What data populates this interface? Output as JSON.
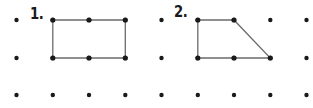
{
  "worksheet": {
    "width": 313,
    "height": 108,
    "background_color": "#ffffff",
    "dot_color": "#1a1a1a",
    "line_color": "#6b6b6b",
    "label_color": "#1a1a1a"
  },
  "grid": {
    "name": "geoboard-dot-grid",
    "columns": 9,
    "rows": 3,
    "x_positions": [
      16.5,
      52.8,
      89.0,
      125.3,
      161.5,
      197.8,
      234.0,
      270.3,
      306.5
    ],
    "y_positions": [
      20,
      58,
      95
    ],
    "dot_radius": 2.2
  },
  "problems": [
    {
      "number": "1.",
      "label_position": {
        "x": 30,
        "y": 7
      },
      "shape_name": "rectangle",
      "vertices": [
        {
          "x": 52.8,
          "y": 20
        },
        {
          "x": 125.3,
          "y": 20
        },
        {
          "x": 125.3,
          "y": 58
        },
        {
          "x": 52.8,
          "y": 58
        }
      ],
      "edge_midpoint_dots": [
        {
          "x": 89.0,
          "y": 20
        },
        {
          "x": 89.0,
          "y": 58
        }
      ]
    },
    {
      "number": "2.",
      "label_position": {
        "x": 174,
        "y": 5
      },
      "shape_name": "trapezoid",
      "vertices": [
        {
          "x": 197.8,
          "y": 20
        },
        {
          "x": 234.0,
          "y": 20
        },
        {
          "x": 270.3,
          "y": 58
        },
        {
          "x": 197.8,
          "y": 58
        }
      ],
      "edge_midpoint_dots": [
        {
          "x": 234.0,
          "y": 58
        }
      ]
    }
  ]
}
